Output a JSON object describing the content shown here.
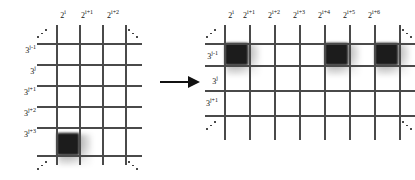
{
  "figure": {
    "background_color": "#ffffff",
    "line_color": "#4a4a4a",
    "block_color": "#1c1c1c",
    "arrow": {
      "name": "transformation-arrow",
      "direction": "right"
    }
  },
  "left_panel": {
    "name": "before-grid",
    "column_labels": [
      "2ⁱ",
      "2ⁱ⁺¹",
      "2ⁱ⁺²"
    ],
    "column_labels_parts": [
      {
        "base": "2",
        "exp": "i"
      },
      {
        "base": "2",
        "exp": "i+1"
      },
      {
        "base": "2",
        "exp": "i+2"
      }
    ],
    "row_labels_parts": [
      {
        "base": "3",
        "exp": "j-1"
      },
      {
        "base": "3",
        "exp": "j"
      },
      {
        "base": "3",
        "exp": "j+1"
      },
      {
        "base": "3",
        "exp": "j+2"
      },
      {
        "base": "3",
        "exp": "j+3"
      }
    ],
    "vertical_line_count": 4,
    "horizontal_line_count": 6,
    "filled_cells": [
      {
        "row_label": "3^(j+3)",
        "column_label": "2^i"
      }
    ],
    "corner_dots": [
      "top-left-up",
      "top-right-down",
      "bottom-left-up",
      "bottom-right-down"
    ]
  },
  "right_panel": {
    "name": "after-grid",
    "column_labels_parts": [
      {
        "base": "2",
        "exp": "i"
      },
      {
        "base": "2",
        "exp": "i+1"
      },
      {
        "base": "2",
        "exp": "i+2"
      },
      {
        "base": "2",
        "exp": "i+3"
      },
      {
        "base": "2",
        "exp": "i+4"
      },
      {
        "base": "2",
        "exp": "i+5"
      },
      {
        "base": "2",
        "exp": "i+6"
      }
    ],
    "row_labels_parts": [
      {
        "base": "3",
        "exp": "j-1"
      },
      {
        "base": "3",
        "exp": "j"
      },
      {
        "base": "3",
        "exp": "j+1"
      }
    ],
    "vertical_line_count": 8,
    "horizontal_line_count": 4,
    "filled_cells": [
      {
        "row_label": "3^(j-1)",
        "column_label": "2^i"
      },
      {
        "row_label": "3^(j-1)",
        "column_label": "2^(i+4)"
      },
      {
        "row_label": "3^(j-1)",
        "column_label": "2^(i+6)"
      }
    ],
    "corner_dots": [
      "top-left-up",
      "top-right-down",
      "bottom-left-up",
      "bottom-right-down"
    ]
  }
}
